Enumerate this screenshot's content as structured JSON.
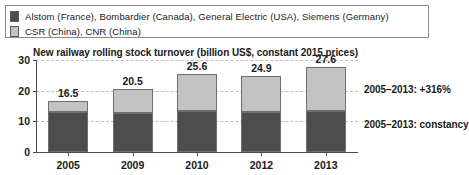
{
  "legend": {
    "items": [
      {
        "label": "Alstom (France), Bombardier (Canada), General Electric (USA), Siemens (Germany)",
        "color": "#4d4d4d"
      },
      {
        "label": "CSR (China), CNR (China)",
        "color": "#c3c3c3"
      }
    ]
  },
  "annotations": {
    "growth": "2005–2013: +316%",
    "constancy": "2005–2013: constancy"
  },
  "axis": {
    "y_ticks": [
      "0",
      "10",
      "20",
      "30"
    ]
  },
  "chart_data": {
    "type": "bar",
    "subtype": "stacked",
    "title": "New railway rolling stock turnover (billion US$, constant 2015 prices)",
    "xlabel": "",
    "ylabel": "",
    "ylim": [
      0,
      30
    ],
    "yticks": [
      0,
      10,
      20,
      30
    ],
    "grid": true,
    "legend_position": "top",
    "categories": [
      "2005",
      "2009",
      "2010",
      "2012",
      "2013"
    ],
    "series": [
      {
        "name": "Alstom (France), Bombardier (Canada), General Electric (USA), Siemens (Germany)",
        "color": "#4d4d4d",
        "values": [
          13.0,
          12.8,
          13.3,
          13.2,
          13.5
        ]
      },
      {
        "name": "CSR (China), CNR (China)",
        "color": "#c3c3c3",
        "values": [
          3.5,
          7.7,
          12.3,
          11.7,
          14.1
        ]
      }
    ],
    "totals": [
      16.5,
      20.5,
      25.6,
      24.9,
      27.6
    ],
    "total_labels": [
      "16.5",
      "20.5",
      "25.6",
      "24.9",
      "27.6"
    ],
    "annotations": [
      "2005–2013: +316%",
      "2005–2013: constancy"
    ]
  }
}
